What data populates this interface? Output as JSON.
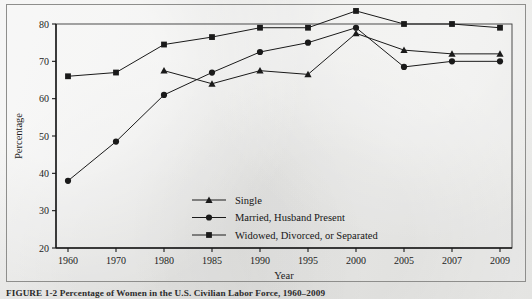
{
  "figure": {
    "caption": "FIGURE 1-2  Percentage of Women in the U.S. Civilian Labor Force, 1960–2009"
  },
  "chart_data": {
    "type": "line",
    "title": "",
    "xlabel": "Year",
    "ylabel": "Percentage",
    "categories": [
      "1960",
      "1970",
      "1980",
      "1985",
      "1990",
      "1995",
      "2000",
      "2005",
      "2007",
      "2009"
    ],
    "ylim": [
      20,
      80
    ],
    "yticks": [
      20,
      30,
      40,
      50,
      60,
      70,
      80
    ],
    "grid": false,
    "legend_position": "inside-lower-center",
    "series": [
      {
        "name": "Single",
        "marker": "triangle",
        "values": [
          null,
          null,
          67.5,
          64.0,
          67.5,
          66.5,
          77.5,
          73.0,
          72.0,
          72.0
        ]
      },
      {
        "name": "Married, Husband Present",
        "marker": "circle",
        "values": [
          38.0,
          48.5,
          61.0,
          67.0,
          72.5,
          75.0,
          79.0,
          68.5,
          70.0,
          70.0
        ]
      },
      {
        "name": "Widowed, Divorced, or Separated",
        "marker": "square",
        "values": [
          66.0,
          67.0,
          74.5,
          76.5,
          79.0,
          79.0,
          83.5,
          80.0,
          80.0,
          79.0
        ]
      }
    ]
  },
  "colors": {
    "ink": "#1a1a1a",
    "axis": "#3a3a3a",
    "frame": "#8e8e8c",
    "paper": "#e9e9e7"
  }
}
